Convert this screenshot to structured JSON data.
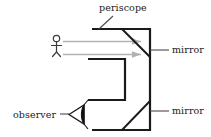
{
  "diagram": {
    "title": "periscope",
    "labels": {
      "periscope": "periscope",
      "mirror_top": "mirror",
      "mirror_bottom": "mirror",
      "observer": "observer"
    },
    "colors": {
      "outline": "#1a1a1a",
      "ray": "#b0b0b0",
      "text": "#1a1a1a",
      "leader": "#5a5a5a",
      "background": "#ffffff"
    },
    "elements": {
      "body_top_line": "top wall of periscope tube",
      "body_right_line": "right wall of periscope tube",
      "body_bottom_line": "bottom wall of periscope tube",
      "inner_bracket": "inner wall of periscope tube",
      "mirror_top_diagonal": "upper 45 degree mirror",
      "mirror_bottom_diagonal": "lower 45 degree mirror",
      "ray_upper": "upper light ray from object",
      "ray_lower": "lower light ray from object",
      "object_figure": "stick figure object being viewed",
      "observer_eye": "eye of observer"
    }
  }
}
